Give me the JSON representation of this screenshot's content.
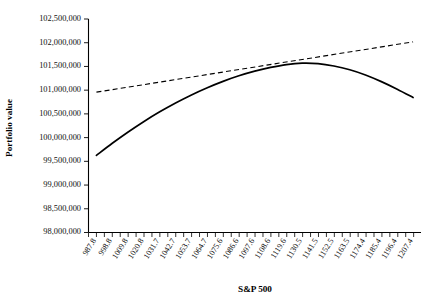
{
  "chart_data": {
    "type": "line",
    "title": "",
    "xlabel": "S&P 500",
    "ylabel": "Portfolio value",
    "xlim": [
      982.3,
      1212.9
    ],
    "ylim": [
      98000000,
      102500000
    ],
    "grid": false,
    "legend": "none",
    "y_tick_labels": [
      "102,500,000",
      "102,000,000",
      "101,500,000",
      "101,000,000",
      "100,500,000",
      "100,000,000",
      "99,500,000",
      "99,000,000",
      "98,500,000",
      "98,000,000"
    ],
    "y_tick_values": [
      102500000,
      102000000,
      101500000,
      101000000,
      100500000,
      100000000,
      99500000,
      99000000,
      98500000,
      98000000
    ],
    "x_tick_labels": [
      "987.8",
      "998.8",
      "1009.8",
      "1020.8",
      "1031.7",
      "1042.7",
      "1053.7",
      "1064.7",
      "1075.6",
      "1086.6",
      "1097.6",
      "1108.6",
      "1119.6",
      "1130.5",
      "1141.5",
      "1152.5",
      "1163.5",
      "1174.4",
      "1185.4",
      "1196.4",
      "1207.4"
    ],
    "x_tick_values": [
      987.8,
      998.8,
      1009.8,
      1020.8,
      1031.7,
      1042.7,
      1053.7,
      1064.7,
      1075.6,
      1086.6,
      1097.6,
      1108.6,
      1119.6,
      1130.5,
      1141.5,
      1152.5,
      1163.5,
      1174.4,
      1185.4,
      1196.4,
      1207.4
    ],
    "minor_ticks_per_label": 2,
    "series": [
      {
        "name": "portfolio-value-curve",
        "style": "solid",
        "x": [
          987.8,
          998.8,
          1009.8,
          1020.8,
          1031.7,
          1042.7,
          1053.7,
          1064.7,
          1075.6,
          1086.6,
          1097.6,
          1108.6,
          1119.6,
          1130.5,
          1141.5,
          1152.5,
          1163.5,
          1174.4,
          1185.4,
          1196.4,
          1207.4
        ],
        "values": [
          99625000,
          99880000,
          100118000,
          100340000,
          100543000,
          100730000,
          100900000,
          101052000,
          101186000,
          101303000,
          101400000,
          101480000,
          101540000,
          101570000,
          101560000,
          101510000,
          101430000,
          101320000,
          101180000,
          101020000,
          100845000
        ]
      },
      {
        "name": "linear-reference-line",
        "style": "dashed",
        "x": [
          987.8,
          1207.4
        ],
        "values": [
          100958000,
          102018000
        ]
      }
    ]
  },
  "axes": {
    "y_title": "Portfolio value",
    "x_title": "S&P 500"
  }
}
